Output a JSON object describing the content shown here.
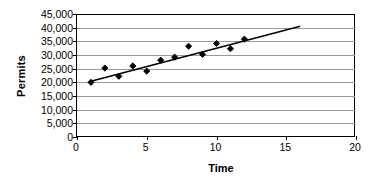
{
  "chart_data": {
    "type": "scatter",
    "title": "",
    "xlabel": "Time",
    "ylabel": "Permits",
    "xlim": [
      0,
      20
    ],
    "ylim": [
      0,
      45000
    ],
    "xticks": [
      0,
      5,
      10,
      15,
      20
    ],
    "yticks": [
      0,
      5000,
      10000,
      15000,
      20000,
      25000,
      30000,
      35000,
      40000,
      45000
    ],
    "ytick_labels": [
      "0",
      "5,000",
      "10,000",
      "15,000",
      "20,000",
      "25,000",
      "30,000",
      "35,000",
      "40,000",
      "45,000"
    ],
    "xtick_labels": [
      "0",
      "5",
      "10",
      "15",
      "20"
    ],
    "grid": "horizontal",
    "legend": "none",
    "marker": "diamond",
    "marker_color": "#000000",
    "line_color": "#000000",
    "x": [
      1,
      2,
      3,
      4,
      5,
      6,
      7,
      8,
      9,
      10,
      11,
      12
    ],
    "values": [
      20000,
      25200,
      22200,
      26000,
      24100,
      28100,
      29200,
      33200,
      30200,
      34200,
      32300,
      35800
    ],
    "points": [
      {
        "x": 1,
        "y": 20000
      },
      {
        "x": 2,
        "y": 25200
      },
      {
        "x": 3,
        "y": 22200
      },
      {
        "x": 4,
        "y": 26000
      },
      {
        "x": 5,
        "y": 24100
      },
      {
        "x": 6,
        "y": 28100
      },
      {
        "x": 7,
        "y": 29200
      },
      {
        "x": 8,
        "y": 33200
      },
      {
        "x": 9,
        "y": 30200
      },
      {
        "x": 10,
        "y": 34200
      },
      {
        "x": 11,
        "y": 32300
      },
      {
        "x": 12,
        "y": 35800
      }
    ],
    "trendline": {
      "type": "linear",
      "x_start": 1,
      "y_start": 20400,
      "x_end": 16,
      "y_end": 40500
    }
  },
  "axes": {
    "y_title": "Permits",
    "x_title": "Time"
  }
}
